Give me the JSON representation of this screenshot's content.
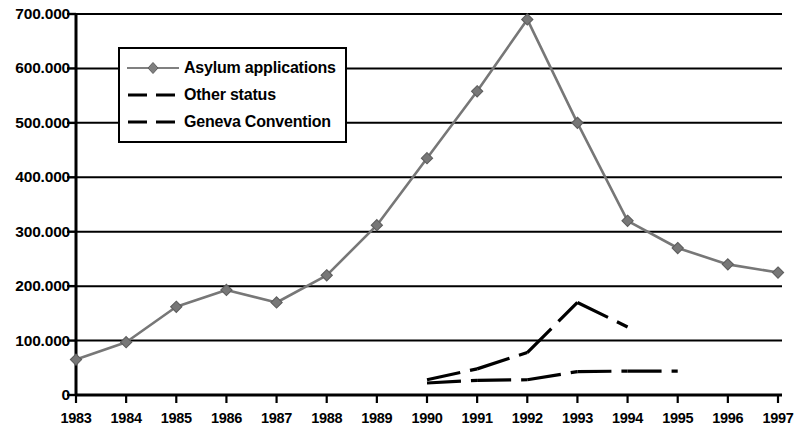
{
  "chart_data": {
    "type": "line",
    "title": "",
    "xlabel": "",
    "ylabel": "",
    "categories": [
      "1983",
      "1984",
      "1985",
      "1986",
      "1987",
      "1988",
      "1989",
      "1990",
      "1991",
      "1992",
      "1993",
      "1994",
      "1995",
      "1996",
      "1997"
    ],
    "ylim": [
      0,
      700000
    ],
    "ytick_values": [
      0,
      100000,
      200000,
      300000,
      400000,
      500000,
      600000,
      700000
    ],
    "ytick_labels": [
      "0",
      "100.000",
      "200.000",
      "300.000",
      "400.000",
      "500.000",
      "600.000",
      "700.000"
    ],
    "grid": "horizontal",
    "legend_position": "upper-left-inside",
    "series": [
      {
        "name": "Asylum applications",
        "style": "solid-with-diamond-markers",
        "color": "#777777",
        "x": [
          "1983",
          "1984",
          "1985",
          "1986",
          "1987",
          "1988",
          "1989",
          "1990",
          "1991",
          "1992",
          "1993",
          "1994",
          "1995",
          "1996",
          "1997"
        ],
        "values": [
          65000,
          97000,
          162000,
          193000,
          170000,
          220000,
          312000,
          435000,
          558000,
          690000,
          500000,
          320000,
          270000,
          240000,
          225000
        ]
      },
      {
        "name": "Other status",
        "style": "dashed",
        "color": "#000000",
        "x": [
          "1990",
          "1991",
          "1992",
          "1993",
          "1994"
        ],
        "values": [
          28000,
          48000,
          78000,
          170000,
          125000
        ]
      },
      {
        "name": "Geneva Convention",
        "style": "dashed",
        "color": "#000000",
        "x": [
          "1990",
          "1991",
          "1992",
          "1993",
          "1994",
          "1995"
        ],
        "values": [
          22000,
          27000,
          28000,
          43000,
          44000,
          44000
        ]
      }
    ]
  },
  "legend": {
    "entries": [
      {
        "label": "Asylum applications",
        "key": "line-diamond-marker"
      },
      {
        "label": "Other status",
        "key": "dashed-line"
      },
      {
        "label": "Geneva Convention",
        "key": "dashed-line"
      }
    ]
  }
}
